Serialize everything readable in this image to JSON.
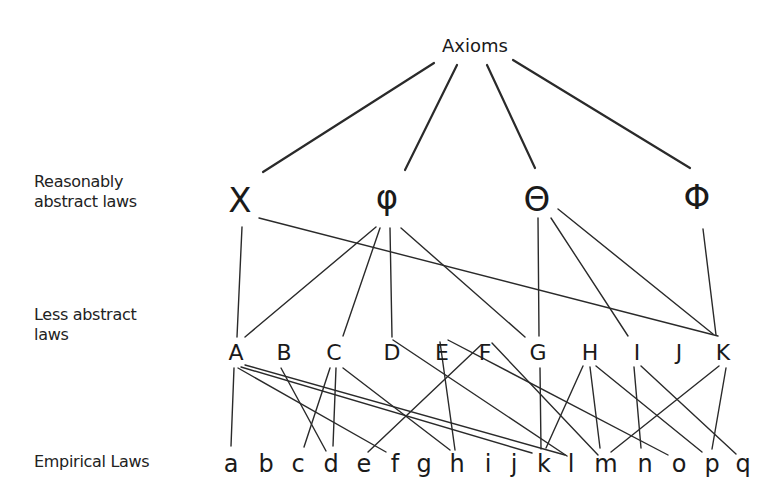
{
  "level_labels": {
    "reasonably_abstract": [
      "Reasonably",
      "abstract laws"
    ],
    "less_abstract": [
      "Less abstract",
      "laws"
    ],
    "empirical": [
      "Empirical Laws"
    ]
  },
  "nodes": {
    "root": [
      {
        "id": "Axioms",
        "label": "Axioms",
        "x": 475,
        "y": 45
      }
    ],
    "reasonably_abstract": [
      {
        "id": "X",
        "label": "X",
        "x": 240,
        "y": 200
      },
      {
        "id": "phi_lower",
        "label": "φ",
        "x": 387,
        "y": 197
      },
      {
        "id": "Theta",
        "label": "Θ",
        "x": 537,
        "y": 199
      },
      {
        "id": "Phi",
        "label": "Φ",
        "x": 697,
        "y": 197
      }
    ],
    "less_abstract": [
      {
        "id": "A",
        "label": "A",
        "x": 236,
        "y": 352
      },
      {
        "id": "B",
        "label": "B",
        "x": 284,
        "y": 352
      },
      {
        "id": "C",
        "label": "C",
        "x": 334,
        "y": 352
      },
      {
        "id": "D",
        "label": "D",
        "x": 392,
        "y": 352
      },
      {
        "id": "E",
        "label": "E",
        "x": 442,
        "y": 352
      },
      {
        "id": "F",
        "label": "F",
        "x": 485,
        "y": 352
      },
      {
        "id": "G",
        "label": "G",
        "x": 538,
        "y": 352
      },
      {
        "id": "H",
        "label": "H",
        "x": 590,
        "y": 352
      },
      {
        "id": "I",
        "label": "I",
        "x": 637,
        "y": 352
      },
      {
        "id": "J",
        "label": "J",
        "x": 679,
        "y": 352
      },
      {
        "id": "K",
        "label": "K",
        "x": 723,
        "y": 352
      }
    ],
    "empirical": [
      {
        "id": "a",
        "label": "a",
        "x": 231,
        "y": 464
      },
      {
        "id": "b",
        "label": "b",
        "x": 266,
        "y": 464
      },
      {
        "id": "c",
        "label": "c",
        "x": 298,
        "y": 464
      },
      {
        "id": "d",
        "label": "d",
        "x": 331,
        "y": 464
      },
      {
        "id": "e",
        "label": "e",
        "x": 364,
        "y": 464
      },
      {
        "id": "f",
        "label": "f",
        "x": 395,
        "y": 464
      },
      {
        "id": "g",
        "label": "g",
        "x": 424,
        "y": 464
      },
      {
        "id": "h",
        "label": "h",
        "x": 457,
        "y": 464
      },
      {
        "id": "i",
        "label": "i",
        "x": 488,
        "y": 464
      },
      {
        "id": "j",
        "label": "j",
        "x": 514,
        "y": 464
      },
      {
        "id": "k",
        "label": "k",
        "x": 544,
        "y": 464
      },
      {
        "id": "l",
        "label": "l",
        "x": 571,
        "y": 464
      },
      {
        "id": "m",
        "label": "m",
        "x": 606,
        "y": 464
      },
      {
        "id": "n",
        "label": "n",
        "x": 645,
        "y": 464
      },
      {
        "id": "o",
        "label": "o",
        "x": 679,
        "y": 464
      },
      {
        "id": "p",
        "label": "p",
        "x": 712,
        "y": 464
      },
      {
        "id": "q",
        "label": "q",
        "x": 743,
        "y": 464
      }
    ]
  },
  "edges": [
    {
      "from": "Axioms",
      "to": "X",
      "x1": 434,
      "y1": 63,
      "x2": 263,
      "y2": 172,
      "top": true
    },
    {
      "from": "Axioms",
      "to": "phi_lower",
      "x1": 457,
      "y1": 65,
      "x2": 405,
      "y2": 170,
      "top": true
    },
    {
      "from": "Axioms",
      "to": "Theta",
      "x1": 487,
      "y1": 65,
      "x2": 535,
      "y2": 168,
      "top": true
    },
    {
      "from": "Axioms",
      "to": "Phi",
      "x1": 513,
      "y1": 60,
      "x2": 690,
      "y2": 168,
      "top": true
    },
    {
      "from": "X",
      "to": "A",
      "x1": 242,
      "y1": 227,
      "x2": 237,
      "y2": 337
    },
    {
      "from": "X",
      "to": "K",
      "x1": 259,
      "y1": 218,
      "x2": 718,
      "y2": 336
    },
    {
      "from": "phi_lower",
      "to": "A",
      "x1": 376,
      "y1": 227,
      "x2": 245,
      "y2": 337
    },
    {
      "from": "phi_lower",
      "to": "C",
      "x1": 380,
      "y1": 228,
      "x2": 343,
      "y2": 336
    },
    {
      "from": "phi_lower",
      "to": "D",
      "x1": 390,
      "y1": 228,
      "x2": 392,
      "y2": 337
    },
    {
      "from": "phi_lower",
      "to": "G",
      "x1": 401,
      "y1": 228,
      "x2": 525,
      "y2": 337
    },
    {
      "from": "Theta",
      "to": "G",
      "x1": 538,
      "y1": 218,
      "x2": 539,
      "y2": 336
    },
    {
      "from": "Theta",
      "to": "I",
      "x1": 551,
      "y1": 218,
      "x2": 628,
      "y2": 336
    },
    {
      "from": "Theta",
      "to": "K",
      "x1": 558,
      "y1": 209,
      "x2": 713,
      "y2": 334
    },
    {
      "from": "Phi",
      "to": "K",
      "x1": 703,
      "y1": 229,
      "x2": 716,
      "y2": 335
    },
    {
      "from": "A",
      "to": "a",
      "x1": 234,
      "y1": 368,
      "x2": 231,
      "y2": 446
    },
    {
      "from": "A",
      "to": "f",
      "x1": 238,
      "y1": 368,
      "x2": 386,
      "y2": 452
    },
    {
      "from": "A",
      "to": "k",
      "x1": 241,
      "y1": 367,
      "x2": 532,
      "y2": 453
    },
    {
      "from": "A",
      "to": "l",
      "x1": 245,
      "y1": 365,
      "x2": 565,
      "y2": 455
    },
    {
      "from": "B",
      "to": "d",
      "x1": 281,
      "y1": 368,
      "x2": 326,
      "y2": 451
    },
    {
      "from": "C",
      "to": "c",
      "x1": 330,
      "y1": 368,
      "x2": 304,
      "y2": 447
    },
    {
      "from": "C",
      "to": "d",
      "x1": 336,
      "y1": 368,
      "x2": 333,
      "y2": 446
    },
    {
      "from": "C",
      "to": "h",
      "x1": 343,
      "y1": 368,
      "x2": 450,
      "y2": 450
    },
    {
      "from": "D",
      "to": "l",
      "x1": 393,
      "y1": 340,
      "x2": 567,
      "y2": 456
    },
    {
      "from": "E",
      "to": "h",
      "x1": 440,
      "y1": 342,
      "x2": 455,
      "y2": 450
    },
    {
      "from": "E",
      "to": "o",
      "x1": 448,
      "y1": 340,
      "x2": 668,
      "y2": 455
    },
    {
      "from": "F",
      "to": "e",
      "x1": 481,
      "y1": 345,
      "x2": 368,
      "y2": 452
    },
    {
      "from": "F",
      "to": "m",
      "x1": 492,
      "y1": 343,
      "x2": 598,
      "y2": 455
    },
    {
      "from": "G",
      "to": "k",
      "x1": 540,
      "y1": 368,
      "x2": 541,
      "y2": 449
    },
    {
      "from": "H",
      "to": "k",
      "x1": 583,
      "y1": 366,
      "x2": 546,
      "y2": 448
    },
    {
      "from": "H",
      "to": "m",
      "x1": 590,
      "y1": 367,
      "x2": 600,
      "y2": 448
    },
    {
      "from": "H",
      "to": "p",
      "x1": 596,
      "y1": 366,
      "x2": 702,
      "y2": 452
    },
    {
      "from": "I",
      "to": "n",
      "x1": 634,
      "y1": 367,
      "x2": 641,
      "y2": 448
    },
    {
      "from": "I",
      "to": "q",
      "x1": 641,
      "y1": 366,
      "x2": 736,
      "y2": 454
    },
    {
      "from": "K",
      "to": "m",
      "x1": 719,
      "y1": 366,
      "x2": 611,
      "y2": 452
    },
    {
      "from": "K",
      "to": "p",
      "x1": 726,
      "y1": 368,
      "x2": 712,
      "y2": 449
    }
  ]
}
